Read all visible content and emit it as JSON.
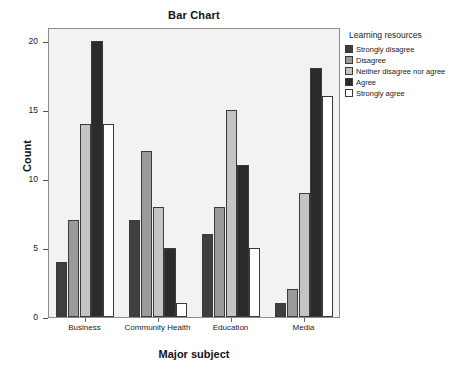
{
  "chart_data": {
    "type": "bar",
    "title": "Bar Chart",
    "xlabel": "Major subject",
    "ylabel": "Count",
    "categories": [
      "Business",
      "Community Health",
      "Education",
      "Media"
    ],
    "series": [
      {
        "name": "Strongly disagree",
        "color": "#3f3f3f",
        "values": [
          4,
          7,
          6,
          1
        ]
      },
      {
        "name": "Disagree",
        "color": "#9a9a9a",
        "values": [
          7,
          12,
          8,
          2
        ]
      },
      {
        "name": "Neither disagree nor agree",
        "color": "#c4c4c4",
        "values": [
          14,
          8,
          15,
          9
        ]
      },
      {
        "name": "Agree",
        "color": "#2b2b2b",
        "values": [
          20,
          5,
          11,
          18
        ]
      },
      {
        "name": "Strongly agree",
        "color": "#ffffff",
        "values": [
          14,
          1,
          5,
          16
        ]
      }
    ],
    "ylim": [
      0,
      21
    ],
    "yticks": [
      0,
      5,
      10,
      15,
      20
    ],
    "ytick_labels": [
      "0",
      "5",
      "10",
      "15",
      "20"
    ],
    "grid": false,
    "legend": {
      "title": "Learning resources",
      "position": "right-top"
    },
    "plot_background": "#f2f2f0"
  }
}
